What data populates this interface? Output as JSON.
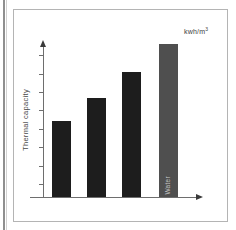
{
  "chart": {
    "unit_base": "kwh/m",
    "unit_sup": "3",
    "y_axis_label": "Thermal capacity"
  },
  "chart_data": {
    "type": "bar",
    "title": "",
    "categories": [
      "",
      "",
      "",
      "Water"
    ],
    "values": [
      50,
      65,
      82,
      100
    ],
    "values_note": "no numeric scale shown; values are relative bar heights, max bar = 100",
    "xlabel": "",
    "ylabel": "Thermal capacity",
    "unit": "kwh/m³",
    "ylim": [
      0,
      110
    ],
    "grid": false,
    "legend": false,
    "colors": {
      "bar_black": "#1d1d1d",
      "bar_gray": "#4f4f4f",
      "bar_label_text": "#c4c4c4",
      "axis": "#6e6e6e",
      "frame_border": "#b4b4b4"
    },
    "bar_colors": [
      "#1d1d1d",
      "#1d1d1d",
      "#1d1d1d",
      "#4f4f4f"
    ],
    "layout": {
      "bar_lefts_px": [
        52,
        87,
        122,
        159
      ],
      "bar_width_px": 19,
      "bar_heights_px": [
        76,
        99,
        125,
        153
      ],
      "baseline_y_px": 197,
      "tick_ys_px": [
        55,
        74,
        92,
        110,
        129,
        147,
        166,
        184
      ]
    }
  }
}
